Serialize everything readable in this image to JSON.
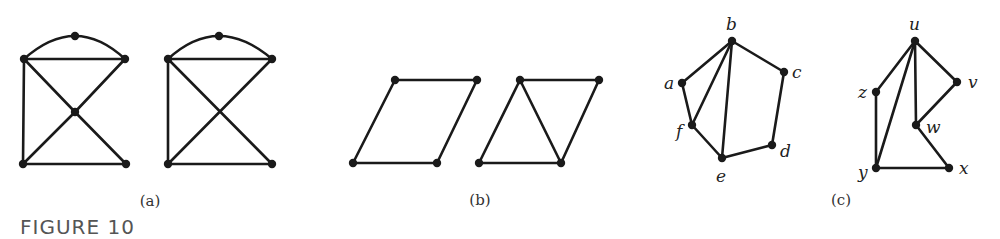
{
  "figure_title": "FIGURE 10",
  "panels": [
    {
      "label": "(a)",
      "graphs": [
        {
          "id": "a1",
          "nodes": [
            {
              "id": "top",
              "x": 75,
              "y": 36
            },
            {
              "id": "tl",
              "x": 24,
              "y": 59
            },
            {
              "id": "tr",
              "x": 125,
              "y": 59
            },
            {
              "id": "c",
              "x": 75,
              "y": 112
            },
            {
              "id": "bl",
              "x": 23,
              "y": 164
            },
            {
              "id": "br",
              "x": 126,
              "y": 164
            }
          ],
          "edges": [
            [
              "tl",
              "tr"
            ],
            [
              "tl",
              "bl"
            ],
            [
              "bl",
              "br"
            ],
            [
              "tl",
              "c"
            ],
            [
              "c",
              "br"
            ],
            [
              "tr",
              "c"
            ],
            [
              "c",
              "bl"
            ]
          ],
          "arcs": [
            [
              "tl",
              "top",
              "tr"
            ]
          ]
        },
        {
          "id": "a2",
          "nodes": [
            {
              "id": "top",
              "x": 219,
              "y": 36
            },
            {
              "id": "tl",
              "x": 168,
              "y": 59
            },
            {
              "id": "tr",
              "x": 272,
              "y": 59
            },
            {
              "id": "bl",
              "x": 168,
              "y": 164
            },
            {
              "id": "br",
              "x": 272,
              "y": 164
            }
          ],
          "edges": [
            [
              "tl",
              "tr"
            ],
            [
              "tl",
              "bl"
            ],
            [
              "bl",
              "br"
            ],
            [
              "tl",
              "br"
            ],
            [
              "tr",
              "bl"
            ]
          ],
          "arcs": [
            [
              "tl",
              "top",
              "tr"
            ]
          ]
        }
      ]
    },
    {
      "label": "(b)",
      "graphs": [
        {
          "id": "b1",
          "nodes": [
            {
              "id": "tl",
              "x": 395,
              "y": 80
            },
            {
              "id": "tr",
              "x": 477,
              "y": 80
            },
            {
              "id": "bl",
              "x": 353,
              "y": 163
            },
            {
              "id": "br",
              "x": 437,
              "y": 163
            }
          ],
          "edges": [
            [
              "tl",
              "tr"
            ],
            [
              "tr",
              "br"
            ],
            [
              "br",
              "bl"
            ],
            [
              "bl",
              "tl"
            ]
          ]
        },
        {
          "id": "b2",
          "nodes": [
            {
              "id": "tl",
              "x": 520,
              "y": 80
            },
            {
              "id": "tr",
              "x": 599,
              "y": 80
            },
            {
              "id": "bl",
              "x": 479,
              "y": 163
            },
            {
              "id": "br",
              "x": 561,
              "y": 163
            }
          ],
          "edges": [
            [
              "tl",
              "tr"
            ],
            [
              "tr",
              "br"
            ],
            [
              "br",
              "bl"
            ],
            [
              "bl",
              "tl"
            ],
            [
              "tl",
              "br"
            ]
          ]
        }
      ]
    },
    {
      "label": "(c)",
      "graphs": [
        {
          "id": "c1",
          "nodes": [
            {
              "id": "a",
              "x": 682,
              "y": 83,
              "label": "a",
              "lx": 664,
              "ly": 89
            },
            {
              "id": "b",
              "x": 732,
              "y": 41,
              "label": "b",
              "lx": 726,
              "ly": 30
            },
            {
              "id": "c",
              "x": 784,
              "y": 72,
              "label": "c",
              "lx": 792,
              "ly": 78
            },
            {
              "id": "d",
              "x": 772,
              "y": 145,
              "label": "d",
              "lx": 780,
              "ly": 157
            },
            {
              "id": "e",
              "x": 722,
              "y": 158,
              "label": "e",
              "lx": 716,
              "ly": 182
            },
            {
              "id": "f",
              "x": 692,
              "y": 125,
              "label": "f",
              "lx": 676,
              "ly": 137
            }
          ],
          "edges": [
            [
              "a",
              "b"
            ],
            [
              "b",
              "c"
            ],
            [
              "c",
              "d"
            ],
            [
              "d",
              "e"
            ],
            [
              "e",
              "f"
            ],
            [
              "f",
              "a"
            ],
            [
              "b",
              "f"
            ],
            [
              "b",
              "e"
            ]
          ]
        },
        {
          "id": "c2",
          "nodes": [
            {
              "id": "u",
              "x": 915,
              "y": 41,
              "label": "u",
              "lx": 909,
              "ly": 30
            },
            {
              "id": "v",
              "x": 957,
              "y": 82,
              "label": "v",
              "lx": 968,
              "ly": 88
            },
            {
              "id": "z",
              "x": 876,
              "y": 92,
              "label": "z",
              "lx": 858,
              "ly": 98
            },
            {
              "id": "w",
              "x": 916,
              "y": 125,
              "label": "w",
              "lx": 926,
              "ly": 133
            },
            {
              "id": "y",
              "x": 876,
              "y": 168,
              "label": "y",
              "lx": 858,
              "ly": 178
            },
            {
              "id": "x",
              "x": 949,
              "y": 168,
              "label": "x",
              "lx": 959,
              "ly": 174
            }
          ],
          "edges": [
            [
              "u",
              "z"
            ],
            [
              "z",
              "y"
            ],
            [
              "u",
              "y"
            ],
            [
              "u",
              "w"
            ],
            [
              "u",
              "v"
            ],
            [
              "v",
              "w"
            ],
            [
              "w",
              "x"
            ],
            [
              "x",
              "y"
            ]
          ]
        }
      ]
    }
  ],
  "panel_label_positions": [
    {
      "x": 150,
      "y": 206
    },
    {
      "x": 480,
      "y": 205
    },
    {
      "x": 841,
      "y": 205
    }
  ]
}
